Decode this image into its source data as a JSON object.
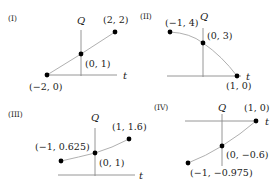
{
  "panels": [
    {
      "id": "I",
      "label": "(I)",
      "x_axis_label": "t",
      "y_axis_label": "Q",
      "curve": "line",
      "points": [
        {
          "t": -2,
          "q": 0,
          "label": "(−2, 0)"
        },
        {
          "t": 0,
          "q": 1,
          "label": "(0, 1)"
        },
        {
          "t": 2,
          "q": 2,
          "label": "(2, 2)"
        }
      ]
    },
    {
      "id": "II",
      "label": "(II)",
      "x_axis_label": "t",
      "y_axis_label": "Q",
      "curve": "concave-down",
      "points": [
        {
          "t": -1,
          "q": 4,
          "label": "(−1, 4)"
        },
        {
          "t": 0,
          "q": 3,
          "label": "(0, 3)"
        },
        {
          "t": 1,
          "q": 0,
          "label": "(1, 0)"
        }
      ]
    },
    {
      "id": "III",
      "label": "(III)",
      "x_axis_label": "t",
      "y_axis_label": "Q",
      "curve": "concave-up",
      "points": [
        {
          "t": -1,
          "q": 0.625,
          "label": "(−1, 0.625)"
        },
        {
          "t": 0,
          "q": 1,
          "label": "(0, 1)"
        },
        {
          "t": 1,
          "q": 1.6,
          "label": "(1, 1.6)"
        }
      ]
    },
    {
      "id": "IV",
      "label": "(IV)",
      "x_axis_label": "t",
      "y_axis_label": "Q",
      "curve": "concave-down",
      "points": [
        {
          "t": -1,
          "q": -0.975,
          "label": "(−1, −0.975)"
        },
        {
          "t": 0,
          "q": -0.6,
          "label": "(0, −0.6)"
        },
        {
          "t": 1,
          "q": 0,
          "label": "(1, 0)"
        }
      ]
    }
  ]
}
